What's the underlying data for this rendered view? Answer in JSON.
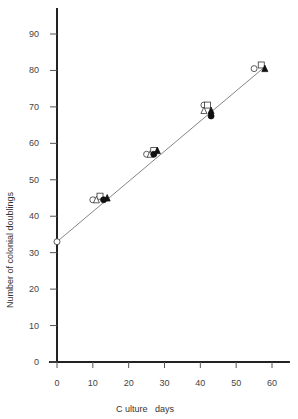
{
  "chart_data": {
    "type": "scatter",
    "title": "",
    "xlabel": "C ulture   days",
    "ylabel": "Number of colonial doublings",
    "xlim": [
      0,
      65
    ],
    "ylim": [
      0,
      95
    ],
    "xticks": [
      0,
      10,
      20,
      30,
      40,
      50,
      60
    ],
    "yticks": [
      0,
      10,
      20,
      30,
      40,
      50,
      60,
      70,
      80,
      90
    ],
    "grid": false,
    "legend": null,
    "fit_line": {
      "x": [
        0,
        58
      ],
      "y": [
        33,
        81
      ]
    },
    "series": [
      {
        "name": "open circle",
        "marker": "circle-open",
        "x": [
          0,
          10,
          25,
          41,
          55
        ],
        "y": [
          33,
          44.5,
          57,
          70.5,
          80.5
        ]
      },
      {
        "name": "open square",
        "marker": "square-open",
        "x": [
          12,
          27,
          42,
          57
        ],
        "y": [
          45.5,
          58,
          70.5,
          81.5
        ]
      },
      {
        "name": "open triangle",
        "marker": "triangle-open",
        "x": [
          11,
          26,
          41
        ],
        "y": [
          44.5,
          57,
          69
        ]
      },
      {
        "name": "filled circle",
        "marker": "circle-filled",
        "x": [
          13,
          27,
          43
        ],
        "y": [
          44.5,
          57,
          67.5
        ]
      },
      {
        "name": "filled triangle",
        "marker": "triangle-filled",
        "x": [
          14,
          28,
          43,
          58
        ],
        "y": [
          45,
          58,
          69,
          80.5
        ]
      }
    ]
  }
}
